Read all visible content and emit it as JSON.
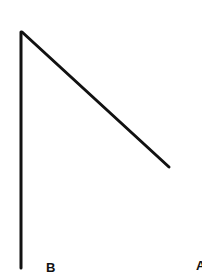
{
  "diagram": {
    "type": "line-drawing",
    "stroke_color": "#111111",
    "background": "#ffffff",
    "lines": [
      {
        "name": "vertical-line",
        "x1": 21,
        "y1": 32,
        "x2": 21,
        "y2": 268
      },
      {
        "name": "diagonal-line",
        "x1": 22,
        "y1": 32,
        "x2": 169,
        "y2": 167
      }
    ],
    "labels": [
      {
        "name": "point-label-b",
        "text": "B",
        "x": 46,
        "y": 261
      },
      {
        "name": "point-label-a",
        "text": "A",
        "x": 196,
        "y": 259
      }
    ]
  }
}
